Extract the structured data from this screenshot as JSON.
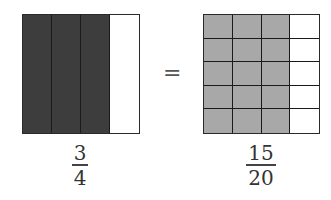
{
  "diagram": {
    "colors": {
      "left_shaded": "#3d3d3d",
      "right_shaded": "#a8a8a8",
      "unshaded": "#ffffff",
      "border": "#1a1a1a"
    },
    "left": {
      "columns": 4,
      "rows": 1,
      "shaded_columns": 3,
      "fraction": {
        "numerator": "3",
        "denominator": "4"
      }
    },
    "equals_sign": "=",
    "right": {
      "columns": 4,
      "rows": 5,
      "shaded_columns": 3,
      "fraction": {
        "numerator": "15",
        "denominator": "20"
      }
    }
  }
}
